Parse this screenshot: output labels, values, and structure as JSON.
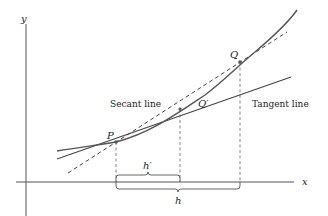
{
  "diagram": {
    "axes": {
      "x_label": "x",
      "y_label": "y"
    },
    "points": [
      {
        "id": "P",
        "label": "P"
      },
      {
        "id": "Qprime",
        "label": "Q′"
      },
      {
        "id": "Q",
        "label": "Q"
      }
    ],
    "lines": {
      "secant_label": "Secant line",
      "tangent_label": "Tangent line"
    },
    "intervals": {
      "h_prime_label": "h′",
      "h_label": "h"
    },
    "colors": {
      "curve": "#555555",
      "axes": "#555555",
      "dashed": "#666666",
      "text": "#222222"
    }
  }
}
